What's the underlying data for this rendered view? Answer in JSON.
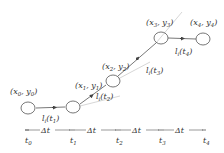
{
  "diagram": {
    "type": "trajectory-timeline",
    "points": [
      {
        "id": "p0",
        "label_x": "x",
        "label_y": "y",
        "sub": "0",
        "cx": 28,
        "cy": 108,
        "lx": 10,
        "ly": 94
      },
      {
        "id": "p1",
        "label_x": "x",
        "label_y": "y",
        "sub": "1",
        "cx": 73,
        "cy": 107,
        "lx": 75,
        "ly": 88
      },
      {
        "id": "p2",
        "label_x": "x",
        "label_y": "y",
        "sub": "2",
        "cx": 113,
        "cy": 81,
        "lx": 102,
        "ly": 69
      },
      {
        "id": "p3",
        "label_x": "x",
        "label_y": "y",
        "sub": "3",
        "cx": 161,
        "cy": 38,
        "lx": 146,
        "ly": 25
      },
      {
        "id": "p4",
        "label_x": "x",
        "label_y": "y",
        "sub": "4",
        "cx": 203,
        "cy": 39,
        "lx": 190,
        "ly": 25
      }
    ],
    "segments": [
      {
        "label": "l",
        "sub_i": "i",
        "arg": "t",
        "arg_sub": "1",
        "x": 42,
        "y": 121
      },
      {
        "label": "l",
        "sub_i": "i",
        "arg": "t",
        "arg_sub": "2",
        "x": 96,
        "y": 99
      },
      {
        "label": "l",
        "sub_i": "i",
        "arg": "t",
        "arg_sub": "3",
        "x": 146,
        "y": 73
      },
      {
        "label": "l",
        "sub_i": "i",
        "arg": "t",
        "arg_sub": "4",
        "x": 175,
        "y": 54
      }
    ],
    "timeline": {
      "delta_label": "Δt",
      "ticks": [
        {
          "label": "t",
          "sub": "0",
          "x": 27
        },
        {
          "label": "t",
          "sub": "1",
          "x": 72
        },
        {
          "label": "t",
          "sub": "2",
          "x": 118
        },
        {
          "label": "t",
          "sub": "3",
          "x": 161
        },
        {
          "label": "t",
          "sub": "4",
          "x": 205
        }
      ]
    },
    "colors": {
      "line": "#444444",
      "faint": "#bbbbbb",
      "text": "#333333"
    }
  }
}
